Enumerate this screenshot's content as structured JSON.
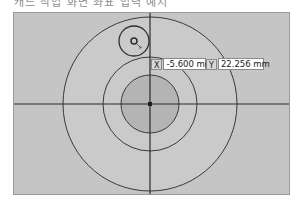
{
  "caption": {
    "text": "캐드 작업 화면 좌표 입력 예시"
  },
  "coordinate_input": {
    "x_label": "X",
    "x_value": "-5.600 mm",
    "y_label": "Y",
    "y_value": "22.256 mm"
  },
  "drawing": {
    "center": [
      150,
      104
    ],
    "outer_circle_radius": 87,
    "middle_circle_radius": 47,
    "inner_circle_radius": 29,
    "small_circle_center": [
      134,
      41
    ],
    "small_circle_radius": 15,
    "tiny_ring_radius": 3,
    "colors": {
      "background": "#c5c5c5",
      "outer_fill": "#cacaca",
      "inner_fill": "#b4b4b4",
      "line": "#3a3a3a"
    }
  }
}
